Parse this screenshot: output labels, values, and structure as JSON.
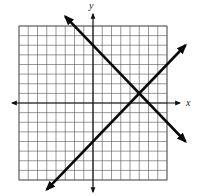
{
  "chart_data": {
    "type": "line",
    "title": "",
    "xlabel": "x",
    "ylabel": "y",
    "xlim": [
      -8,
      8
    ],
    "ylim": [
      -8,
      8
    ],
    "grid": true,
    "grid_step": 1,
    "series": [
      {
        "name": "line-decreasing",
        "equation": "y = -x + 6",
        "slope": -1,
        "intercept": 6,
        "points": [
          [
            -3,
            9
          ],
          [
            10,
            -4
          ]
        ]
      },
      {
        "name": "line-increasing",
        "equation": "y = x - 4",
        "slope": 1,
        "intercept": -4,
        "points": [
          [
            -5,
            -9
          ],
          [
            10,
            6
          ]
        ]
      }
    ],
    "annotations": [
      {
        "type": "intersection",
        "x": 5,
        "y": 1
      }
    ]
  },
  "labels": {
    "x_axis": "x",
    "y_axis": "y"
  },
  "colors": {
    "grid": "#555555",
    "axis": "#111111",
    "line": "#0a0a0a",
    "background": "#ffffff"
  }
}
